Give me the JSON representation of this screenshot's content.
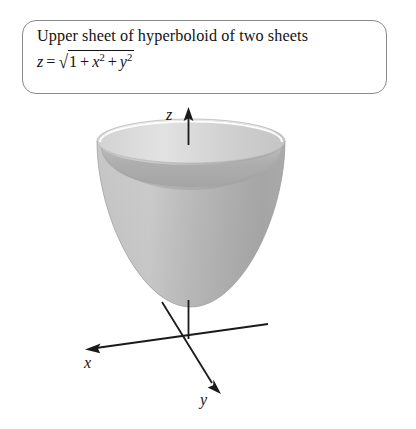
{
  "caption": {
    "title": "Upper sheet of hyperboloid of two sheets",
    "formula_plain": "z = √(1 + x² + y²)",
    "formula_parts": {
      "lhs_variable": "z",
      "equals": "=",
      "radical_sign": "√",
      "term_constant": "1",
      "plus_1": "+",
      "term_x_base": "x",
      "term_x_exponent": "2",
      "plus_2": "+",
      "term_y_base": "y",
      "term_y_exponent": "2"
    }
  },
  "figure": {
    "axes": [
      {
        "name": "x-axis",
        "label": "x",
        "direction": "down-left"
      },
      {
        "name": "y-axis",
        "label": "y",
        "direction": "down-right"
      },
      {
        "name": "z-axis",
        "label": "z",
        "direction": "up"
      }
    ],
    "surface": {
      "name": "upper-sheet-hyperboloid",
      "description": "Upward-opening bowl (upper sheet of a hyperboloid of two sheets) with elliptical rim, vertex above the origin on the z-axis.",
      "fill_outer": "#c9c9c9",
      "fill_inner": "#b0b0b0",
      "fill_rim_top": "#d8d8d8",
      "highlight": "#ffffff",
      "outline": "#9a9a9a"
    },
    "colors": {
      "axis_line": "#1a1a1a",
      "box_border": "#8a8a8a",
      "text": "#141414",
      "background": "#ffffff"
    }
  }
}
